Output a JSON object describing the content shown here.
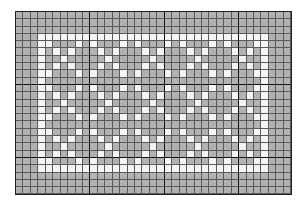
{
  "pattern_grid": {
    "columns": 37,
    "rows": 25,
    "major_line_every": 10,
    "colors": {
      "background_cell": "#b2b2b2",
      "pattern_cell": "#f4f4f4",
      "minor_line": "#5a5a5a",
      "major_line": "#111111"
    },
    "frame": {
      "top_row": 3,
      "bottom_row": 21,
      "left_col": 3,
      "right_col": 33
    },
    "x_motifs": {
      "size": 5,
      "block_rows": [
        4,
        10,
        16
      ],
      "block_cols": [
        4,
        10,
        16,
        22,
        28
      ]
    }
  }
}
